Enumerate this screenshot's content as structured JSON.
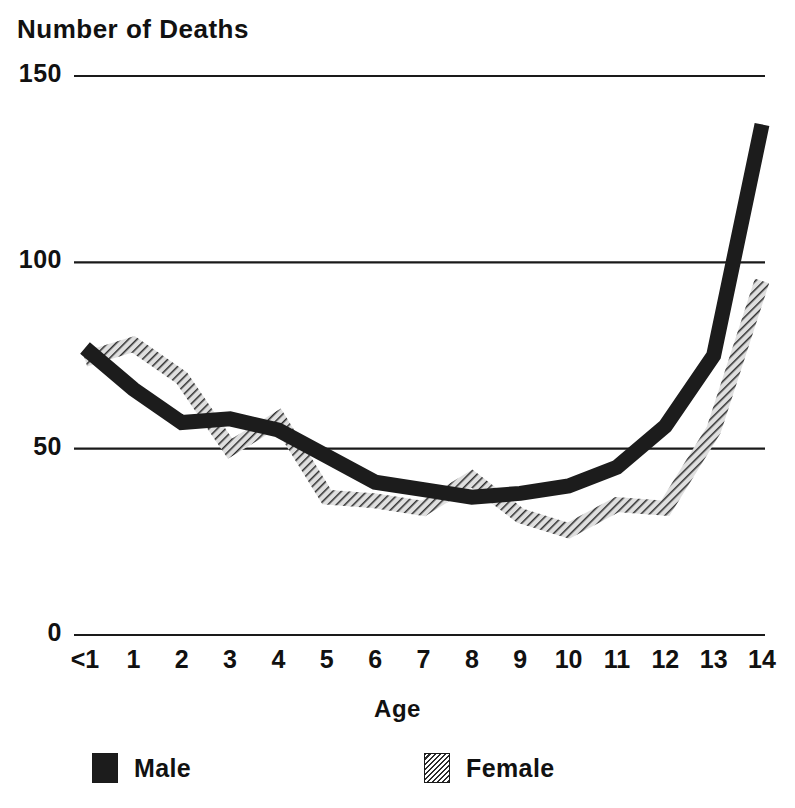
{
  "chart_data": {
    "type": "line",
    "title": "Number of Deaths",
    "xlabel": "Age",
    "ylabel": "",
    "categories": [
      "<1",
      "1",
      "2",
      "3",
      "4",
      "5",
      "6",
      "7",
      "8",
      "9",
      "10",
      "11",
      "12",
      "13",
      "14"
    ],
    "series": [
      {
        "name": "Male",
        "style": "solid-black",
        "color": "#1c1c1c",
        "values": [
          77,
          66,
          57,
          58,
          55,
          48,
          41,
          39,
          37,
          38,
          40,
          45,
          56,
          75,
          137
        ]
      },
      {
        "name": "Female",
        "style": "diagonal-hatch",
        "color": "#555555",
        "values": [
          74,
          78,
          69,
          50,
          58,
          37,
          36,
          34,
          42,
          32,
          28,
          35,
          34,
          55,
          95
        ]
      }
    ],
    "ylim": [
      0,
      150
    ],
    "yticks": [
      0,
      50,
      100,
      150
    ],
    "ytick_labels": [
      "0",
      "50",
      "100",
      "150"
    ],
    "grid": "horizontal",
    "legend_position": "bottom",
    "legend_entries": [
      "Male",
      "Female"
    ]
  },
  "axes": {
    "y_tick_labels": [
      "150",
      "100",
      "50",
      "0"
    ],
    "x_tick_labels": [
      "<1",
      "1",
      "2",
      "3",
      "4",
      "5",
      "6",
      "7",
      "8",
      "9",
      "10",
      "11",
      "12",
      "13",
      "14"
    ],
    "x_axis_title": "Age"
  },
  "legend": {
    "items": [
      {
        "label": "Male",
        "swatch": "solid-black-swatch"
      },
      {
        "label": "Female",
        "swatch": "hatched-swatch"
      }
    ]
  },
  "colors": {
    "male": "#1c1c1c",
    "female_hatch": "#2b2b2b",
    "grid": "#1a1a1a",
    "text": "#111111",
    "background": "#ffffff"
  }
}
